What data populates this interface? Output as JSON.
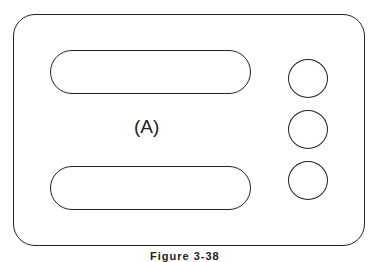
{
  "diagram": {
    "label": "(A)",
    "caption": "Figure 3-38",
    "shapes": {
      "outer_panel": "rounded-rectangle",
      "slots": [
        "top-slot",
        "bottom-slot"
      ],
      "holes": [
        "hole-1",
        "hole-2",
        "hole-3"
      ]
    },
    "stroke_color": "#222222",
    "background": "#ffffff"
  }
}
